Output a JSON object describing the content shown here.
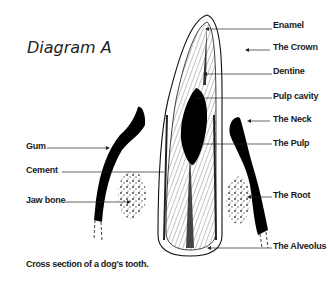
{
  "title": "Diagram A",
  "caption": "Cross section of a dog's tooth.",
  "labels_right": [
    {
      "text": "Enamel",
      "y": 20
    },
    {
      "text": "The Crown",
      "y": 42
    },
    {
      "text": "Dentine",
      "y": 66
    },
    {
      "text": "Pulp cavity",
      "y": 91
    },
    {
      "text": "The Neck",
      "y": 114
    },
    {
      "text": "The Pulp",
      "y": 138
    },
    {
      "text": "The Root",
      "y": 190
    },
    {
      "text": "The Alveolus",
      "y": 241
    }
  ],
  "labels_left": [
    {
      "text": "Gum",
      "y": 141
    },
    {
      "text": "Cement",
      "y": 165
    },
    {
      "text": "Jaw bone",
      "y": 195
    }
  ],
  "colors": {
    "ink": "#111111",
    "background": "#ffffff"
  }
}
